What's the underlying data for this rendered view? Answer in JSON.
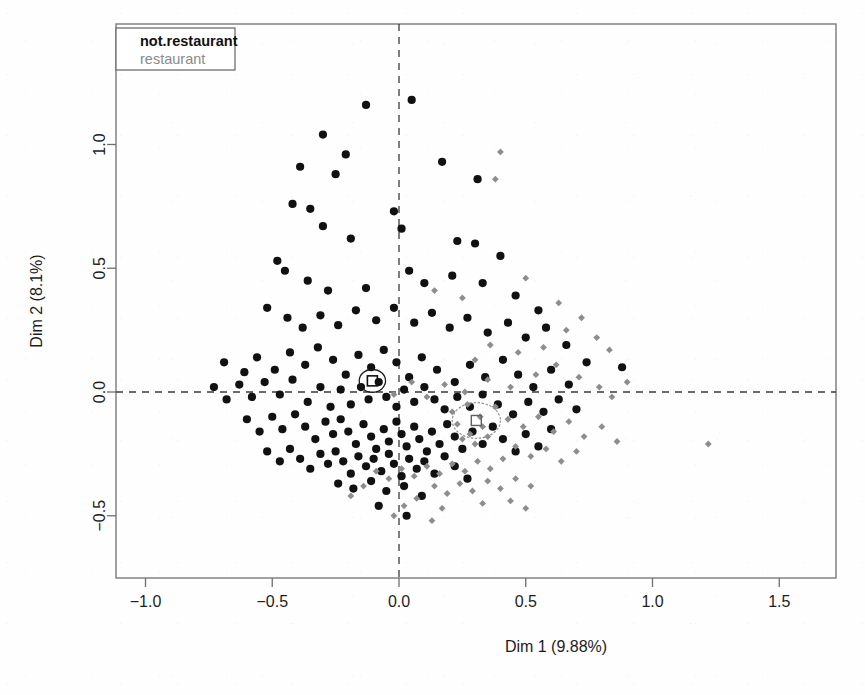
{
  "figure": {
    "kind": "mca-factor-map-scatter",
    "background_color": "#fefefe",
    "frame": {
      "left": 116,
      "top": 24,
      "right": 836,
      "bottom": 578
    }
  },
  "legend": {
    "position": "top-left",
    "box": {
      "x": 116,
      "y": 28,
      "width": 119,
      "height": 42
    },
    "entries": [
      {
        "label": "not.restaurant",
        "color": "#111111",
        "style": "bold",
        "marker": "filled-circle"
      },
      {
        "label": "restaurant",
        "color": "#8a8a8a",
        "style": "normal",
        "marker": "small-diamond"
      }
    ]
  },
  "chart_data": {
    "type": "scatter",
    "title": "",
    "xlabel": "Dim 1 (9.88%)",
    "ylabel": "Dim 2 (8.1%)",
    "xlim": [
      -1.18,
      1.72
    ],
    "ylim": [
      -0.73,
      1.32
    ],
    "xticks": [
      -1.0,
      -0.5,
      0.0,
      0.5,
      1.0,
      1.5
    ],
    "xtick_labels": [
      "-1.0",
      "-0.5",
      "0.0",
      "0.5",
      "1.0",
      "1.5"
    ],
    "yticks": [
      -0.5,
      0.0,
      0.5,
      1.0
    ],
    "ytick_labels": [
      "-0.5",
      "0.0",
      "0.5",
      "1.0"
    ],
    "grid": false,
    "reference_lines": [
      {
        "orientation": "vertical",
        "value": 0.0,
        "style": "dashed"
      },
      {
        "orientation": "horizontal",
        "value": 0.0,
        "style": "dashed"
      }
    ],
    "legend_position": "upper left",
    "series": [
      {
        "name": "not.restaurant",
        "color": "#111111",
        "marker": "filled-circle",
        "centroid": [
          -0.105,
          0.045
        ],
        "confidence_ellipse": {
          "center": [
            -0.105,
            0.045
          ],
          "rx": 0.052,
          "ry": 0.046
        },
        "points": [
          [
            -0.13,
            1.16
          ],
          [
            0.05,
            1.18
          ],
          [
            -0.3,
            1.04
          ],
          [
            -0.21,
            0.96
          ],
          [
            -0.39,
            0.91
          ],
          [
            -0.25,
            0.88
          ],
          [
            0.17,
            0.93
          ],
          [
            0.31,
            0.86
          ],
          [
            -0.42,
            0.76
          ],
          [
            -0.35,
            0.74
          ],
          [
            -0.3,
            0.67
          ],
          [
            -0.19,
            0.62
          ],
          [
            -0.02,
            0.73
          ],
          [
            0.01,
            0.66
          ],
          [
            0.23,
            0.61
          ],
          [
            0.3,
            0.6
          ],
          [
            0.4,
            0.55
          ],
          [
            -0.48,
            0.53
          ],
          [
            -0.45,
            0.49
          ],
          [
            -0.36,
            0.45
          ],
          [
            -0.28,
            0.41
          ],
          [
            -0.13,
            0.42
          ],
          [
            0.04,
            0.49
          ],
          [
            0.1,
            0.44
          ],
          [
            0.21,
            0.47
          ],
          [
            0.33,
            0.44
          ],
          [
            0.46,
            0.39
          ],
          [
            0.55,
            0.33
          ],
          [
            -0.52,
            0.34
          ],
          [
            -0.44,
            0.3
          ],
          [
            -0.38,
            0.26
          ],
          [
            -0.31,
            0.31
          ],
          [
            -0.24,
            0.27
          ],
          [
            -0.17,
            0.33
          ],
          [
            -0.09,
            0.29
          ],
          [
            -0.02,
            0.34
          ],
          [
            0.06,
            0.28
          ],
          [
            0.13,
            0.32
          ],
          [
            0.2,
            0.26
          ],
          [
            0.27,
            0.3
          ],
          [
            0.35,
            0.24
          ],
          [
            0.43,
            0.28
          ],
          [
            0.5,
            0.22
          ],
          [
            0.58,
            0.26
          ],
          [
            0.66,
            0.19
          ],
          [
            0.74,
            0.12
          ],
          [
            0.88,
            0.1
          ],
          [
            -0.69,
            0.12
          ],
          [
            -0.61,
            0.08
          ],
          [
            -0.56,
            0.14
          ],
          [
            -0.49,
            0.09
          ],
          [
            -0.43,
            0.16
          ],
          [
            -0.37,
            0.11
          ],
          [
            -0.32,
            0.18
          ],
          [
            -0.26,
            0.13
          ],
          [
            -0.21,
            0.07
          ],
          [
            -0.16,
            0.15
          ],
          [
            -0.11,
            0.1
          ],
          [
            -0.06,
            0.17
          ],
          [
            -0.01,
            0.12
          ],
          [
            0.04,
            0.06
          ],
          [
            0.09,
            0.14
          ],
          [
            0.15,
            0.09
          ],
          [
            0.22,
            0.04
          ],
          [
            0.28,
            0.11
          ],
          [
            0.34,
            0.06
          ],
          [
            0.41,
            0.13
          ],
          [
            0.47,
            0.07
          ],
          [
            0.53,
            0.02
          ],
          [
            0.6,
            0.09
          ],
          [
            0.67,
            0.03
          ],
          [
            -0.73,
            0.02
          ],
          [
            -0.68,
            -0.03
          ],
          [
            -0.63,
            0.03
          ],
          [
            -0.58,
            -0.02
          ],
          [
            -0.53,
            0.04
          ],
          [
            -0.47,
            -0.01
          ],
          [
            -0.42,
            0.05
          ],
          [
            -0.36,
            -0.04
          ],
          [
            -0.31,
            0.02
          ],
          [
            -0.27,
            -0.06
          ],
          [
            -0.23,
            0.01
          ],
          [
            -0.19,
            -0.05
          ],
          [
            -0.15,
            0.02
          ],
          [
            -0.12,
            -0.03
          ],
          [
            -0.08,
            0.04
          ],
          [
            -0.05,
            -0.02
          ],
          [
            -0.01,
            -0.06
          ],
          [
            0.02,
            0.01
          ],
          [
            0.06,
            -0.04
          ],
          [
            0.1,
            0.02
          ],
          [
            0.14,
            -0.03
          ],
          [
            0.18,
            -0.07
          ],
          [
            0.23,
            -0.02
          ],
          [
            0.28,
            -0.06
          ],
          [
            0.33,
            -0.01
          ],
          [
            0.39,
            -0.05
          ],
          [
            0.45,
            -0.09
          ],
          [
            0.51,
            -0.04
          ],
          [
            0.57,
            -0.08
          ],
          [
            0.63,
            -0.03
          ],
          [
            0.7,
            -0.07
          ],
          [
            -0.6,
            -0.11
          ],
          [
            -0.55,
            -0.16
          ],
          [
            -0.5,
            -0.1
          ],
          [
            -0.46,
            -0.15
          ],
          [
            -0.41,
            -0.09
          ],
          [
            -0.37,
            -0.14
          ],
          [
            -0.33,
            -0.19
          ],
          [
            -0.29,
            -0.12
          ],
          [
            -0.26,
            -0.17
          ],
          [
            -0.23,
            -0.11
          ],
          [
            -0.2,
            -0.16
          ],
          [
            -0.17,
            -0.21
          ],
          [
            -0.14,
            -0.13
          ],
          [
            -0.11,
            -0.18
          ],
          [
            -0.09,
            -0.23
          ],
          [
            -0.06,
            -0.15
          ],
          [
            -0.04,
            -0.2
          ],
          [
            -0.01,
            -0.12
          ],
          [
            0.01,
            -0.17
          ],
          [
            0.03,
            -0.22
          ],
          [
            0.06,
            -0.14
          ],
          [
            0.08,
            -0.19
          ],
          [
            0.11,
            -0.24
          ],
          [
            0.13,
            -0.16
          ],
          [
            0.16,
            -0.21
          ],
          [
            0.19,
            -0.13
          ],
          [
            0.22,
            -0.18
          ],
          [
            0.25,
            -0.23
          ],
          [
            0.29,
            -0.16
          ],
          [
            0.33,
            -0.21
          ],
          [
            0.37,
            -0.14
          ],
          [
            0.41,
            -0.19
          ],
          [
            0.46,
            -0.24
          ],
          [
            0.5,
            -0.17
          ],
          [
            0.55,
            -0.22
          ],
          [
            0.6,
            -0.15
          ],
          [
            -0.52,
            -0.24
          ],
          [
            -0.47,
            -0.28
          ],
          [
            -0.43,
            -0.23
          ],
          [
            -0.39,
            -0.27
          ],
          [
            -0.35,
            -0.31
          ],
          [
            -0.31,
            -0.25
          ],
          [
            -0.28,
            -0.29
          ],
          [
            -0.25,
            -0.24
          ],
          [
            -0.22,
            -0.28
          ],
          [
            -0.19,
            -0.33
          ],
          [
            -0.16,
            -0.26
          ],
          [
            -0.13,
            -0.3
          ],
          [
            -0.1,
            -0.27
          ],
          [
            -0.07,
            -0.32
          ],
          [
            -0.04,
            -0.25
          ],
          [
            -0.02,
            -0.29
          ],
          [
            0.01,
            -0.34
          ],
          [
            0.04,
            -0.27
          ],
          [
            0.07,
            -0.31
          ],
          [
            0.1,
            -0.28
          ],
          [
            0.14,
            -0.33
          ],
          [
            0.18,
            -0.26
          ],
          [
            0.22,
            -0.3
          ],
          [
            0.27,
            -0.35
          ],
          [
            -0.24,
            -0.37
          ],
          [
            -0.18,
            -0.39
          ],
          [
            -0.11,
            -0.36
          ],
          [
            -0.05,
            -0.4
          ],
          [
            0.02,
            -0.38
          ],
          [
            0.09,
            -0.42
          ],
          [
            0.03,
            -0.5
          ],
          [
            -0.08,
            -0.46
          ]
        ]
      },
      {
        "name": "restaurant",
        "color": "#8d8d8d",
        "marker": "small-diamond",
        "centroid": [
          0.305,
          -0.115
        ],
        "confidence_ellipse": {
          "center": [
            0.305,
            -0.115
          ],
          "rx": 0.095,
          "ry": 0.072
        },
        "points": [
          [
            0.4,
            0.97
          ],
          [
            0.38,
            0.86
          ],
          [
            0.14,
            0.41
          ],
          [
            0.25,
            0.38
          ],
          [
            0.5,
            0.46
          ],
          [
            0.63,
            0.36
          ],
          [
            0.72,
            0.3
          ],
          [
            0.78,
            0.22
          ],
          [
            0.83,
            0.17
          ],
          [
            0.66,
            0.25
          ],
          [
            0.57,
            0.18
          ],
          [
            0.47,
            0.16
          ],
          [
            0.36,
            0.19
          ],
          [
            0.3,
            0.13
          ],
          [
            0.71,
            0.06
          ],
          [
            0.79,
            0.02
          ],
          [
            0.84,
            -0.02
          ],
          [
            0.9,
            0.04
          ],
          [
            0.62,
            0.11
          ],
          [
            0.54,
            0.07
          ],
          [
            0.44,
            0.02
          ],
          [
            0.35,
            0.05
          ],
          [
            0.26,
            0.0
          ],
          [
            0.18,
            0.03
          ],
          [
            0.11,
            -0.02
          ],
          [
            0.05,
            0.04
          ],
          [
            -0.02,
            -0.01
          ],
          [
            0.21,
            -0.08
          ],
          [
            0.27,
            -0.05
          ],
          [
            0.32,
            -0.1
          ],
          [
            0.38,
            -0.06
          ],
          [
            0.43,
            -0.11
          ],
          [
            0.33,
            -0.14
          ],
          [
            0.28,
            -0.17
          ],
          [
            0.23,
            -0.13
          ],
          [
            0.35,
            -0.18
          ],
          [
            0.3,
            -0.21
          ],
          [
            0.25,
            -0.19
          ],
          [
            0.49,
            -0.14
          ],
          [
            0.55,
            -0.1
          ],
          [
            0.61,
            -0.16
          ],
          [
            0.67,
            -0.12
          ],
          [
            0.73,
            -0.18
          ],
          [
            0.8,
            -0.14
          ],
          [
            0.86,
            -0.2
          ],
          [
            1.22,
            -0.21
          ],
          [
            0.46,
            -0.22
          ],
          [
            0.52,
            -0.26
          ],
          [
            0.58,
            -0.23
          ],
          [
            0.64,
            -0.28
          ],
          [
            0.7,
            -0.24
          ],
          [
            0.41,
            -0.27
          ],
          [
            0.36,
            -0.31
          ],
          [
            0.31,
            -0.28
          ],
          [
            0.26,
            -0.32
          ],
          [
            0.21,
            -0.29
          ],
          [
            0.16,
            -0.33
          ],
          [
            0.11,
            -0.3
          ],
          [
            0.06,
            -0.34
          ],
          [
            0.01,
            -0.31
          ],
          [
            -0.04,
            -0.35
          ],
          [
            -0.09,
            -0.32
          ],
          [
            0.14,
            -0.38
          ],
          [
            0.19,
            -0.41
          ],
          [
            0.24,
            -0.37
          ],
          [
            0.29,
            -0.4
          ],
          [
            0.35,
            -0.36
          ],
          [
            0.4,
            -0.39
          ],
          [
            0.46,
            -0.35
          ],
          [
            0.52,
            -0.38
          ],
          [
            -0.14,
            -0.38
          ],
          [
            -0.19,
            -0.42
          ],
          [
            0.07,
            -0.43
          ],
          [
            0.02,
            -0.46
          ],
          [
            0.17,
            -0.47
          ],
          [
            0.33,
            -0.45
          ],
          [
            0.44,
            -0.44
          ],
          [
            0.5,
            -0.47
          ],
          [
            0.13,
            -0.52
          ],
          [
            -0.02,
            -0.5
          ]
        ]
      }
    ]
  }
}
